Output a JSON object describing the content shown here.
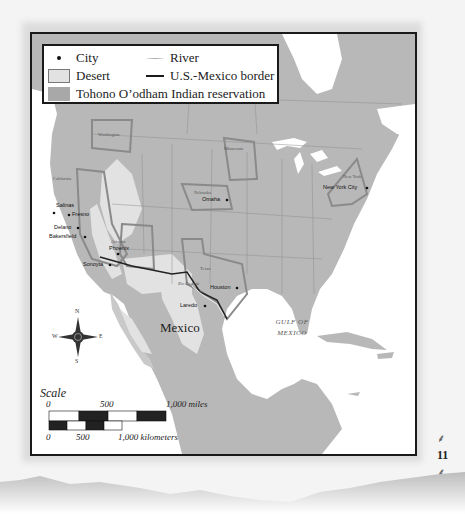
{
  "legend": {
    "city": "City",
    "river": "River",
    "desert": "Desert",
    "border": "U.S.-Mexico border",
    "reservation": "Tohono O’odham Indian reservation"
  },
  "states": {
    "washington": "Washington",
    "minnesota": "Minnesota",
    "california": "California",
    "nebraska": "Nebraska",
    "new_york": "New York",
    "arizona": "Arizona",
    "texas": "Texas"
  },
  "cities": {
    "salinas": "Salinas",
    "fresno": "Fresno",
    "delano": "Delano",
    "bakersfield": "Bakersfield",
    "phoenix": "Phoenix",
    "sonoyta": "Sonoyta",
    "omaha": "Omaha",
    "new_york_city": "New York City",
    "houston": "Houston",
    "laredo": "Laredo"
  },
  "features": {
    "river_label": "Rio Grande",
    "country": "Mexico",
    "gulf_line1": "GULF OF",
    "gulf_line2": "MEXICO"
  },
  "compass": {
    "n": "N",
    "s": "S",
    "e": "E",
    "w": "W"
  },
  "scale": {
    "title": "Scale",
    "miles_0": "0",
    "miles_500": "500",
    "miles_1000": "1,000 miles",
    "km_0": "0",
    "km_500": "500",
    "km_1000": "1,000 kilometers"
  },
  "page_number": "11",
  "colors": {
    "land": "#b8b8b8",
    "desert": "#e2e2e2",
    "highlight_border": "#8a8a8a",
    "water": "#ffffff"
  }
}
